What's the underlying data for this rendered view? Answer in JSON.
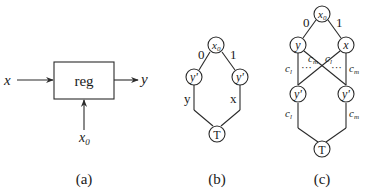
{
  "panel_a": {
    "caption": "(a)",
    "block_label": "reg",
    "input_label": "x",
    "output_label": "y",
    "control_label_base": "x",
    "control_label_sub": "0"
  },
  "panel_b": {
    "caption": "(b)",
    "root": {
      "base": "x",
      "sub": "0"
    },
    "left_edge_label": "0",
    "right_edge_label": "1",
    "left_node": "y'",
    "right_node": "y'",
    "left_path_label": "y",
    "right_path_label": "x",
    "terminal": "T"
  },
  "panel_c": {
    "caption": "(c)",
    "root": {
      "base": "x",
      "sub": "0"
    },
    "left_edge_label": "0",
    "right_edge_label": "1",
    "left_node": "y",
    "right_node": "x",
    "left_lower_node": "y'",
    "right_lower_node": "y'",
    "left_vertical_label": {
      "base": "c",
      "sub": "l"
    },
    "cross_label_left": {
      "base": "c",
      "sub": "m"
    },
    "cross_label_right": {
      "base": "c",
      "sub": "l"
    },
    "right_vertical_label": {
      "base": "c",
      "sub": "m"
    },
    "dots": "···",
    "lower_left_label": {
      "base": "c",
      "sub": "l"
    },
    "lower_right_label": {
      "base": "c",
      "sub": "m"
    },
    "terminal": "T"
  }
}
